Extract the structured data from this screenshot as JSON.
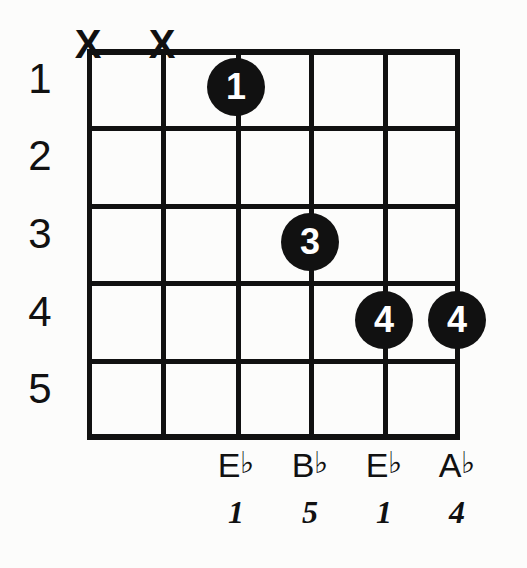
{
  "diagram": {
    "kind": "guitar-chord-diagram",
    "ink_color": "#111111",
    "background_color": "#fcfcfb",
    "fret_numbers": [
      "1",
      "2",
      "3",
      "4",
      "5"
    ],
    "strings": [
      {
        "index": 1,
        "mute_marker": "X",
        "note": null,
        "flat": false,
        "interval": null,
        "finger": null,
        "fret": null
      },
      {
        "index": 2,
        "mute_marker": "X",
        "note": null,
        "flat": false,
        "interval": null,
        "finger": null,
        "fret": null
      },
      {
        "index": 3,
        "mute_marker": null,
        "note": "E",
        "flat": true,
        "interval": "1",
        "finger": "1",
        "fret": 1
      },
      {
        "index": 4,
        "mute_marker": null,
        "note": "B",
        "flat": true,
        "interval": "5",
        "finger": "3",
        "fret": 3
      },
      {
        "index": 5,
        "mute_marker": null,
        "note": "E",
        "flat": true,
        "interval": "1",
        "finger": "4",
        "fret": 4
      },
      {
        "index": 6,
        "mute_marker": null,
        "note": "A",
        "flat": true,
        "interval": "4",
        "finger": "4",
        "fret": 4
      }
    ],
    "mute_markers": [
      {
        "string": 1,
        "label": "X"
      },
      {
        "string": 2,
        "label": "X"
      }
    ],
    "finger_dots": [
      {
        "string": 3,
        "fret": 1,
        "label": "1"
      },
      {
        "string": 4,
        "fret": 3,
        "label": "3"
      },
      {
        "string": 5,
        "fret": 4,
        "label": "4"
      },
      {
        "string": 6,
        "fret": 4,
        "label": "4"
      }
    ],
    "note_names": [
      {
        "string": 3,
        "letter": "E",
        "accidental": "♭"
      },
      {
        "string": 4,
        "letter": "B",
        "accidental": "♭"
      },
      {
        "string": 5,
        "letter": "E",
        "accidental": "♭"
      },
      {
        "string": 6,
        "letter": "A",
        "accidental": "♭"
      }
    ],
    "intervals": [
      {
        "string": 3,
        "label": "1"
      },
      {
        "string": 4,
        "label": "5"
      },
      {
        "string": 5,
        "label": "1"
      },
      {
        "string": 6,
        "label": "4"
      }
    ]
  }
}
